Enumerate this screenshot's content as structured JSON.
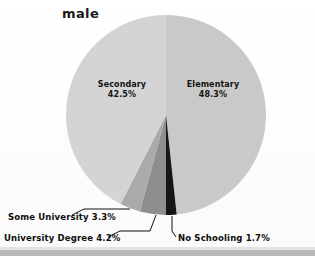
{
  "chart_data": {
    "type": "pie",
    "title": "male",
    "xlabel": "",
    "ylabel": "",
    "legend_position": "none",
    "grid": false,
    "categories": [
      "Elementary",
      "No Schooling",
      "University Degree",
      "Some University",
      "Secondary"
    ],
    "values": [
      48.3,
      1.7,
      4.2,
      3.3,
      42.5
    ],
    "units": "%",
    "start_angle_deg": 0,
    "direction": "clockwise",
    "slices": [
      {
        "name": "Elementary",
        "value": 48.3,
        "label": "Elementary",
        "value_label": "48.3%",
        "color": "#c9c9c9",
        "label_placement": "inside"
      },
      {
        "name": "No Schooling",
        "value": 1.7,
        "label": "No Schooling",
        "value_label": "1.7%",
        "callout_text": "No Schooling 1.7%",
        "color": "#161616",
        "label_placement": "callout-right"
      },
      {
        "name": "University Degree",
        "value": 4.2,
        "label": "University Degree",
        "value_label": "4.2%",
        "callout_text": "University Degree 4.2%",
        "color": "#8e8e8e",
        "label_placement": "callout-left"
      },
      {
        "name": "Some University",
        "value": 3.3,
        "label": "Some University",
        "value_label": "3.3%",
        "callout_text": "Some University 3.3%",
        "color": "#aaaaaa",
        "label_placement": "callout-left"
      },
      {
        "name": "Secondary",
        "value": 42.5,
        "label": "Secondary",
        "value_label": "42.5%",
        "color": "#d4d4d4",
        "label_placement": "inside"
      }
    ]
  },
  "labels": {
    "secondary_name": "Secondary",
    "secondary_value": "42.5%",
    "elementary_name": "Elementary",
    "elementary_value": "48.3%",
    "some_university": "Some University 3.3%",
    "university_degree": "University Degree 4.2%",
    "no_schooling": "No Schooling 1.7%"
  },
  "colors": {
    "background": "#fdfdfd",
    "text": "#141414",
    "rule": "#b9b9b9",
    "elementary": "#c9c9c9",
    "secondary": "#d4d4d4",
    "some_university": "#aaaaaa",
    "university_degree": "#8e8e8e",
    "no_schooling": "#161616"
  }
}
